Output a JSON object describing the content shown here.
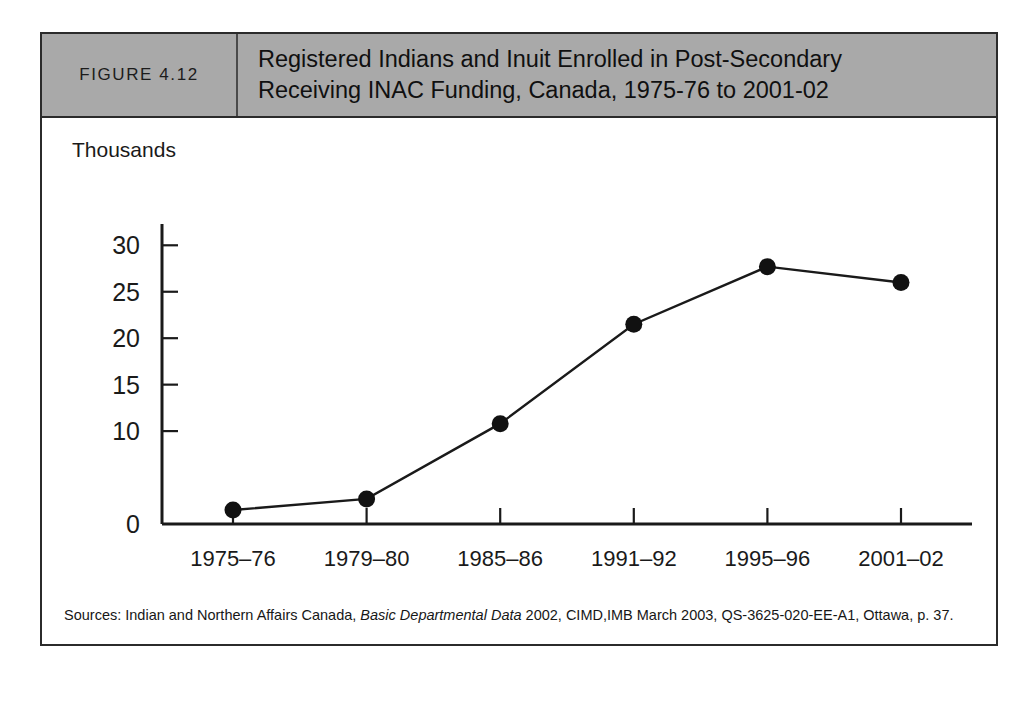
{
  "figure": {
    "number_label": "FIGURE 4.12",
    "title_line_1": "Registered Indians and Inuit Enrolled in Post-Secondary",
    "title_line_2": "Receiving INAC Funding, Canada, 1975-76 to 2001-02",
    "header_bg": "#a9a9a9",
    "border_color": "#2b2b2b"
  },
  "source": {
    "prefix": "Sources: Indian and Northern Affairs Canada, ",
    "italic": "Basic Departmental Data",
    "suffix": " 2002, CIMD,IMB March 2003, QS-3625-020-EE-A1, Ottawa, p. 37."
  },
  "chart_data": {
    "type": "line",
    "title": "Registered Indians and Inuit Enrolled in Post-Secondary Receiving INAC Funding, Canada, 1975-76 to 2001-02",
    "subtitle": "",
    "xlabel": "Year",
    "ylabel": "Thousands",
    "categories": [
      "1975–76",
      "1979–80",
      "1985–86",
      "1991–92",
      "1995–96",
      "2001–02"
    ],
    "values": [
      1.5,
      2.7,
      10.8,
      21.5,
      27.7,
      26.0
    ],
    "ylim": [
      0,
      31
    ],
    "ytick_values": [
      30,
      25,
      20,
      15,
      10,
      0
    ],
    "ytick_labels": [
      "30",
      "25",
      "20",
      "15",
      "10",
      "0"
    ],
    "grid": false,
    "legend": false,
    "legend_position": "none",
    "marker": "filled-circle",
    "line_color": "#1a1a1a",
    "marker_color": "#111111"
  }
}
